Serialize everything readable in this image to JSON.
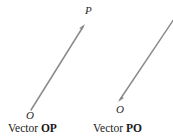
{
  "figure": {
    "background_color": "#ffffff",
    "stroke_color": "#8a8a8a",
    "text_color": "#1a1a1a"
  },
  "diagram": {
    "type": "vector-diagram",
    "left": {
      "caption_prefix": "Vector ",
      "caption_name": "OP",
      "start_label": "O",
      "end_label": "P",
      "arrow_direction": "up-right",
      "tail": {
        "x": 31,
        "y": 110
      },
      "tip": {
        "x": 85,
        "y": 24
      }
    },
    "right": {
      "caption_prefix": "Vector ",
      "caption_name": "PO",
      "start_label": "O",
      "arrow_direction": "down-left",
      "tail": {
        "x": 173,
        "y": 20
      },
      "tip": {
        "x": 118,
        "y": 102
      }
    }
  }
}
